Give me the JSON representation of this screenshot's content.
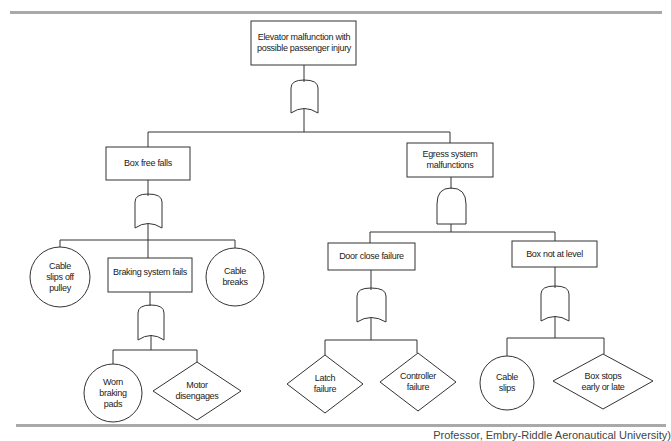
{
  "diagram": {
    "type": "fault-tree",
    "top_event": {
      "label": "Elevator malfunction with possible passenger injury",
      "gate": "OR"
    },
    "intermediate_events": [
      {
        "id": "box_free_falls",
        "label": "Box free falls",
        "gate": "OR"
      },
      {
        "id": "egress",
        "label": "Egress system malfunctions",
        "gate": "AND"
      },
      {
        "id": "braking",
        "label": "Braking system fails",
        "gate": "OR"
      },
      {
        "id": "door_close",
        "label": "Door close failure",
        "gate": "OR"
      },
      {
        "id": "box_not_level",
        "label": "Box not at level",
        "gate": "OR"
      }
    ],
    "basic_events": [
      {
        "id": "cable_slips_pulley",
        "label": "Cable slips off pulley",
        "shape": "circle"
      },
      {
        "id": "cable_breaks",
        "label": "Cable breaks",
        "shape": "circle"
      },
      {
        "id": "worn_pads",
        "label": "Worn braking pads",
        "shape": "circle"
      },
      {
        "id": "cable_slips",
        "label": "Cable slips",
        "shape": "circle"
      }
    ],
    "undeveloped_events": [
      {
        "id": "motor",
        "label": "Motor disengages",
        "shape": "diamond"
      },
      {
        "id": "latch",
        "label": "Latch failure",
        "shape": "diamond"
      },
      {
        "id": "controller",
        "label": "Controller failure",
        "shape": "diamond"
      },
      {
        "id": "box_stops",
        "label": "Box stops early or late",
        "shape": "diamond"
      }
    ]
  },
  "caption": "Professor, Embry-Riddle Aeronautical University)",
  "colors": {
    "line": "#333333",
    "rule": "#a9a9a9"
  }
}
